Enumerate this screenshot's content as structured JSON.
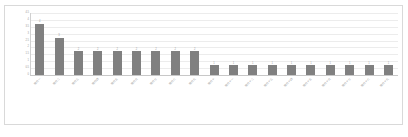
{
  "chart_data": {
    "type": "bar",
    "title": "",
    "subtitle": "",
    "xlabel": "",
    "ylabel": "",
    "grid": true,
    "legend": false,
    "legend_position": "none",
    "ylim": [
      0,
      4.5
    ],
    "y_ticks": [
      "0",
      "0.5",
      "1",
      "1.5",
      "2",
      "2.5",
      "3",
      "3.5",
      "4",
      "4.5"
    ],
    "bar_color": "#808080",
    "gridline_color": "#ececec",
    "border_color": "#d9d9d9",
    "axis_color": "#c8c8c8",
    "label_color": "#9a9a9a",
    "categories": [
      "項目一",
      "項目二",
      "項目三",
      "項目四",
      "項目五",
      "項目六",
      "項目七",
      "項目八",
      "項目九",
      "項目十",
      "項目十一",
      "項目十二",
      "項目十三",
      "項目十四",
      "項目十五",
      "項目十六",
      "項目十七",
      "項目十八",
      "項目十九"
    ],
    "values": [
      4,
      3,
      2,
      2,
      2,
      2,
      2,
      2,
      2,
      1,
      1,
      1,
      1,
      1,
      1,
      1,
      1,
      1,
      1
    ],
    "value_labels": [
      "4",
      "3",
      "2",
      "2",
      "2",
      "2",
      "2",
      "2",
      "2",
      "1",
      "1",
      "1",
      "1",
      "1",
      "1",
      "1",
      "1",
      "1",
      "1"
    ]
  }
}
